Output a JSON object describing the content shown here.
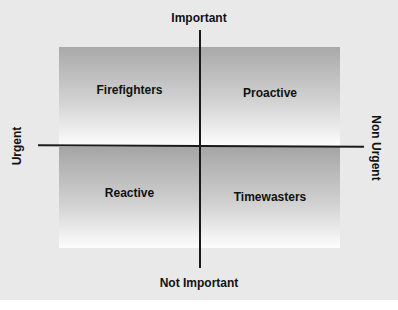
{
  "diagram": {
    "type": "quadrant-matrix",
    "axes": {
      "top": "Important",
      "bottom": "Not Important",
      "left": "Urgent",
      "right": "Non Urgent"
    },
    "quadrants": [
      {
        "position": "top-left",
        "label": "Firefighters"
      },
      {
        "position": "top-right",
        "label": "Proactive"
      },
      {
        "position": "bottom-left",
        "label": "Reactive"
      },
      {
        "position": "bottom-right",
        "label": "Timewasters"
      }
    ],
    "colors": {
      "background": "#e9e9e9",
      "gradient_dark": "#a9a9a9",
      "gradient_light": "#fdfdfd",
      "axis_line": "#1a1a1a",
      "text": "#111111"
    }
  }
}
